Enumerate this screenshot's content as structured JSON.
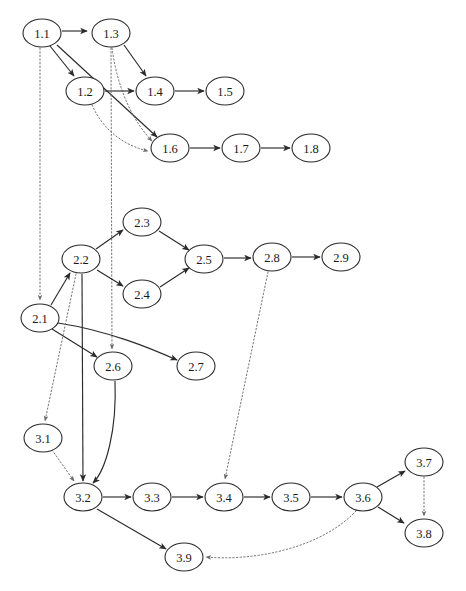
{
  "diagram": {
    "type": "directed-graph",
    "width": 466,
    "height": 591,
    "background_color": "#ffffff",
    "solid_edge_color": "#2b2b2b",
    "dotted_edge_color": "#6a6a6a",
    "node_fill_color": "#ffffff",
    "node_stroke_color": "#2b2b2b",
    "node_rx": 19,
    "node_ry": 14
  },
  "nodes": [
    {
      "id": "1.1",
      "label": "1.1",
      "x": 42,
      "y": 33,
      "cluster": "1"
    },
    {
      "id": "1.2",
      "label": "1.2",
      "x": 85,
      "y": 91,
      "cluster": "1"
    },
    {
      "id": "1.3",
      "label": "1.3",
      "x": 111,
      "y": 33,
      "cluster": "1"
    },
    {
      "id": "1.4",
      "label": "1.4",
      "x": 155,
      "y": 91,
      "cluster": "1"
    },
    {
      "id": "1.5",
      "label": "1.5",
      "x": 225,
      "y": 91,
      "cluster": "1"
    },
    {
      "id": "1.6",
      "label": "1.6",
      "x": 170,
      "y": 148,
      "cluster": "1"
    },
    {
      "id": "1.7",
      "label": "1.7",
      "x": 241,
      "y": 148,
      "cluster": "1"
    },
    {
      "id": "1.8",
      "label": "1.8",
      "x": 311,
      "y": 148,
      "cluster": "1"
    },
    {
      "id": "2.1",
      "label": "2.1",
      "x": 40,
      "y": 318,
      "cluster": "2"
    },
    {
      "id": "2.2",
      "label": "2.2",
      "x": 81,
      "y": 259,
      "cluster": "2"
    },
    {
      "id": "2.3",
      "label": "2.3",
      "x": 142,
      "y": 222,
      "cluster": "2"
    },
    {
      "id": "2.4",
      "label": "2.4",
      "x": 142,
      "y": 294,
      "cluster": "2"
    },
    {
      "id": "2.5",
      "label": "2.5",
      "x": 204,
      "y": 259,
      "cluster": "2"
    },
    {
      "id": "2.6",
      "label": "2.6",
      "x": 113,
      "y": 366,
      "cluster": "2"
    },
    {
      "id": "2.7",
      "label": "2.7",
      "x": 196,
      "y": 366,
      "cluster": "2"
    },
    {
      "id": "2.8",
      "label": "2.8",
      "x": 272,
      "y": 257,
      "cluster": "2"
    },
    {
      "id": "2.9",
      "label": "2.9",
      "x": 341,
      "y": 257,
      "cluster": "2"
    },
    {
      "id": "3.1",
      "label": "3.1",
      "x": 43,
      "y": 438,
      "cluster": "3"
    },
    {
      "id": "3.2",
      "label": "3.2",
      "x": 83,
      "y": 497,
      "cluster": "3"
    },
    {
      "id": "3.3",
      "label": "3.3",
      "x": 152,
      "y": 497,
      "cluster": "3"
    },
    {
      "id": "3.4",
      "label": "3.4",
      "x": 224,
      "y": 497,
      "cluster": "3"
    },
    {
      "id": "3.5",
      "label": "3.5",
      "x": 291,
      "y": 497,
      "cluster": "3"
    },
    {
      "id": "3.6",
      "label": "3.6",
      "x": 363,
      "y": 497,
      "cluster": "3"
    },
    {
      "id": "3.7",
      "label": "3.7",
      "x": 424,
      "y": 462,
      "cluster": "3"
    },
    {
      "id": "3.8",
      "label": "3.8",
      "x": 424,
      "y": 533,
      "cluster": "3"
    },
    {
      "id": "3.9",
      "label": "3.9",
      "x": 184,
      "y": 557,
      "cluster": "3"
    }
  ],
  "edges": [
    {
      "from": "1.1",
      "to": "1.3",
      "style": "solid",
      "path": "M 62,31 L 87,31"
    },
    {
      "from": "1.1",
      "to": "1.2",
      "style": "solid",
      "path": "M 50,46 L 74,76"
    },
    {
      "from": "1.1",
      "to": "1.6",
      "style": "solid",
      "path": "M 57,45 L 157,137"
    },
    {
      "from": "1.3",
      "to": "1.4",
      "style": "solid",
      "path": "M 124,45 L 146,76"
    },
    {
      "from": "1.3",
      "to": "1.6",
      "style": "dotted",
      "path": "M 112,48 C 118,92 134,122 152,141"
    },
    {
      "from": "1.2",
      "to": "1.4",
      "style": "solid",
      "path": "M 105,91 L 134,91"
    },
    {
      "from": "1.2",
      "to": "1.6",
      "style": "dotted",
      "path": "M 92,105 C 104,132 126,146 148,151"
    },
    {
      "from": "1.4",
      "to": "1.5",
      "style": "solid",
      "path": "M 175,91 L 204,91"
    },
    {
      "from": "1.6",
      "to": "1.7",
      "style": "solid",
      "path": "M 190,148 L 220,148"
    },
    {
      "from": "1.7",
      "to": "1.8",
      "style": "solid",
      "path": "M 261,148 L 290,148"
    },
    {
      "from": "1.1",
      "to": "2.1",
      "style": "dotted",
      "path": "M 40,48 L 40,300"
    },
    {
      "from": "1.3",
      "to": "2.6",
      "style": "dotted",
      "path": "M 111,48 L 112,349"
    },
    {
      "from": "2.1",
      "to": "2.2",
      "style": "solid",
      "path": "M 51,305 L 70,273"
    },
    {
      "from": "2.2",
      "to": "2.3",
      "style": "solid",
      "path": "M 96,249 L 123,230"
    },
    {
      "from": "2.2",
      "to": "2.4",
      "style": "solid",
      "path": "M 97,270 L 123,286"
    },
    {
      "from": "2.3",
      "to": "2.5",
      "style": "solid",
      "path": "M 159,231 L 189,250"
    },
    {
      "from": "2.4",
      "to": "2.5",
      "style": "solid",
      "path": "M 160,287 L 189,268"
    },
    {
      "from": "2.5",
      "to": "2.8",
      "style": "solid",
      "path": "M 224,258 L 251,258"
    },
    {
      "from": "2.8",
      "to": "2.9",
      "style": "solid",
      "path": "M 292,257 L 320,257"
    },
    {
      "from": "2.1",
      "to": "2.6",
      "style": "solid",
      "path": "M 52,329 L 97,357"
    },
    {
      "from": "2.1",
      "to": "2.7",
      "style": "solid",
      "path": "M 58,323 C 110,331 152,349 177,360"
    },
    {
      "from": "2.2",
      "to": "3.1",
      "style": "dotted",
      "path": "M 76,274 L 45,421"
    },
    {
      "from": "2.2",
      "to": "3.2",
      "style": "solid",
      "path": "M 82,274 L 83,481"
    },
    {
      "from": "2.6",
      "to": "3.2",
      "style": "solid",
      "path": "M 115,381 C 117,430 106,470 93,483"
    },
    {
      "from": "3.1",
      "to": "3.2",
      "style": "dotted",
      "path": "M 52,450 L 74,481"
    },
    {
      "from": "2.8",
      "to": "3.4",
      "style": "dotted",
      "path": "M 268,272 L 225,479"
    },
    {
      "from": "3.2",
      "to": "3.3",
      "style": "solid",
      "path": "M 103,497 L 131,497"
    },
    {
      "from": "3.3",
      "to": "3.4",
      "style": "solid",
      "path": "M 172,497 L 203,497"
    },
    {
      "from": "3.4",
      "to": "3.5",
      "style": "solid",
      "path": "M 244,497 L 270,497"
    },
    {
      "from": "3.5",
      "to": "3.6",
      "style": "solid",
      "path": "M 311,497 L 342,497"
    },
    {
      "from": "3.6",
      "to": "3.7",
      "style": "solid",
      "path": "M 377,487 L 405,471"
    },
    {
      "from": "3.6",
      "to": "3.8",
      "style": "solid",
      "path": "M 378,507 L 404,523"
    },
    {
      "from": "3.7",
      "to": "3.8",
      "style": "dotted",
      "path": "M 424,477 L 424,516"
    },
    {
      "from": "3.2",
      "to": "3.9",
      "style": "solid",
      "path": "M 97,509 L 166,549"
    },
    {
      "from": "3.6",
      "to": "3.9",
      "style": "dotted",
      "path": "M 356,511 C 318,551 248,561 206,557"
    }
  ]
}
